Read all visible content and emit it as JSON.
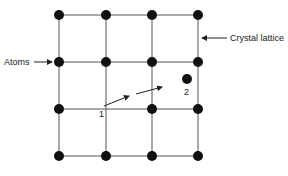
{
  "diagram": {
    "labels": {
      "atoms": "Atoms",
      "crystal_lattice": "Crystal lattice",
      "position_1": "1",
      "position_2": "2"
    },
    "colors": {
      "atom": "#111111",
      "line": "#555555",
      "text": "#222222",
      "background": "#ffffff"
    },
    "grid": {
      "columns_x": [
        59,
        106,
        152,
        198
      ],
      "rows_y": [
        15,
        62,
        109,
        156
      ],
      "missing_node": {
        "col": 1,
        "row": 2
      }
    },
    "interstitial_atom": {
      "x": 187,
      "y": 79
    }
  }
}
